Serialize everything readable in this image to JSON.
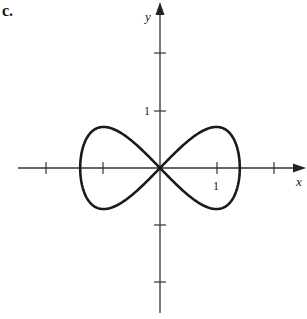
{
  "panel_label": "c.",
  "axes": {
    "x_label": "x",
    "y_label": "y",
    "x_tick_label": "1",
    "y_tick_label": "1"
  },
  "colors": {
    "curve": "#1a1a1a",
    "axis": "#333333",
    "background": "#ffffff"
  },
  "chart_data": {
    "type": "line",
    "title": "",
    "xlabel": "x",
    "ylabel": "y",
    "xlim": [
      -2.3,
      2.6
    ],
    "ylim": [
      -2.5,
      2.9
    ],
    "x_ticks": [
      -2,
      -1,
      1,
      2
    ],
    "y_ticks": [
      -2,
      -1,
      1,
      2
    ],
    "labeled_ticks": {
      "x": [
        1
      ],
      "y": [
        1
      ]
    },
    "grid": false,
    "parametric": "x = 1.4 sin t, y = 0.72 sin 2t",
    "series": [
      {
        "name": "curve",
        "points": [
          [
            0,
            0
          ],
          [
            0.5,
            0.48
          ],
          [
            0.99,
            0.72
          ],
          [
            1.3,
            0.5
          ],
          [
            1.4,
            0
          ],
          [
            1.3,
            -0.5
          ],
          [
            0.99,
            -0.72
          ],
          [
            0.5,
            -0.48
          ],
          [
            0,
            0
          ],
          [
            -0.5,
            0.48
          ],
          [
            -0.99,
            0.72
          ],
          [
            -1.3,
            0.5
          ],
          [
            -1.4,
            0
          ],
          [
            -1.3,
            -0.5
          ],
          [
            -0.99,
            -0.72
          ],
          [
            -0.5,
            -0.48
          ],
          [
            0,
            0
          ]
        ]
      }
    ]
  }
}
